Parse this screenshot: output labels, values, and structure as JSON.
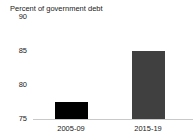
{
  "title": "Percent of government debt",
  "colors": {
    "background": "#ffffff",
    "text": "#1a1a1a",
    "axis_line": "#c9c9c9"
  },
  "chart_data": {
    "type": "bar",
    "title": "Percent of government debt",
    "categories": [
      "2005-09",
      "2015-19"
    ],
    "values": [
      77.5,
      85
    ],
    "bar_colors": [
      "#000000",
      "#404040"
    ],
    "xlabel": "",
    "ylabel": "Percent of government debt",
    "ylim": [
      75,
      90
    ],
    "yticks": [
      75,
      80,
      85,
      90
    ],
    "grid": false,
    "legend": false
  }
}
